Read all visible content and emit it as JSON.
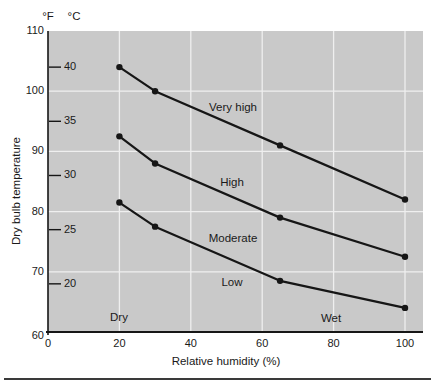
{
  "chart_data": {
    "type": "line",
    "title": "",
    "xlabel": "Relative humidity (%)",
    "ylabel": "Dry bulb temperature",
    "y_units": [
      "°F",
      "°C"
    ],
    "xlim": [
      0,
      105
    ],
    "ylim_f": [
      60,
      110
    ],
    "x_ticks": [
      0,
      20,
      40,
      60,
      80,
      100
    ],
    "f_ticks": [
      110,
      100,
      90,
      80,
      70,
      60
    ],
    "c_ticks": [
      40,
      35,
      30,
      25,
      20
    ],
    "grid": "on",
    "x": [
      20,
      30,
      65,
      100
    ],
    "series": [
      {
        "name": "very-high-boundary",
        "label": "Very high",
        "values_f": [
          104,
          100,
          91,
          82
        ]
      },
      {
        "name": "high-boundary",
        "label": "High",
        "values_f": [
          92.5,
          88,
          79,
          72.5
        ]
      },
      {
        "name": "moderate-boundary",
        "label": "Moderate",
        "values_f": [
          81.5,
          77.5,
          68.5,
          64
        ]
      }
    ],
    "zone_annotations": [
      "Very high",
      "High",
      "Moderate",
      "Low"
    ],
    "region_annotations": [
      "Dry",
      "Wet"
    ],
    "colors": {
      "plot_bg": "#c9c9c9",
      "grid": "#efefef",
      "line": "#161616",
      "axis": "#161616",
      "text": "#1a1a1a",
      "rule": "#3a3a3a"
    }
  }
}
